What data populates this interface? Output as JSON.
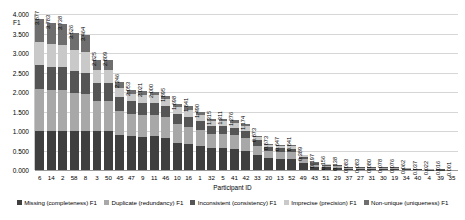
{
  "chart_data": {
    "type": "bar",
    "subtype": "stacked-vertical",
    "title": "",
    "xlabel": "Participant ID",
    "ylabel": "F1",
    "ylim": [
      0,
      4.0
    ],
    "yticks": [
      "0.000",
      "0.500",
      "1.000",
      "1.500",
      "2.000",
      "2.500",
      "3.000",
      "3.500",
      "4.000"
    ],
    "ytick_values": [
      0,
      0.5,
      1.0,
      1.5,
      2.0,
      2.5,
      3.0,
      3.5,
      4.0
    ],
    "grid": true,
    "legend_position": "bottom",
    "categories": [
      "6",
      "14",
      "2",
      "58",
      "8",
      "3",
      "50",
      "45",
      "47",
      "9",
      "11",
      "46",
      "10",
      "16",
      "1",
      "32",
      "5",
      "41",
      "42",
      "33",
      "20",
      "13",
      "52",
      "49",
      "43",
      "51",
      "29",
      "37",
      "27",
      "31",
      "30",
      "19",
      "34",
      "40",
      "4",
      "39",
      "35"
    ],
    "total_labels": [
      "3.877",
      "3.783",
      "3.738",
      "3.526",
      "3.464",
      "2.825",
      "2.809",
      "2.246",
      "2.053",
      "2.021",
      "2.000",
      "1.895",
      "1.698",
      "1.641",
      "1.490",
      "1.315",
      "1.311",
      "1.276",
      "1.174",
      "0.873",
      "0.673",
      "0.647",
      "0.641",
      "0.389",
      "0.197",
      "0.156",
      "0.138",
      "0.083",
      "0.083",
      "0.080",
      "0.078",
      "0.076",
      "0.062",
      "0.037",
      "0.022",
      "0.016",
      "0.001"
    ],
    "totals": [
      3.877,
      3.783,
      3.738,
      3.526,
      3.464,
      2.825,
      2.809,
      2.246,
      2.053,
      2.021,
      2.0,
      1.895,
      1.698,
      1.641,
      1.49,
      1.315,
      1.311,
      1.276,
      1.174,
      0.873,
      0.673,
      0.647,
      0.641,
      0.389,
      0.197,
      0.156,
      0.138,
      0.083,
      0.083,
      0.08,
      0.078,
      0.076,
      0.062,
      0.037,
      0.022,
      0.016,
      0.001
    ],
    "series": [
      {
        "name": "Missing (completeness) F1",
        "color": "#3f3f3f",
        "values": [
          1.0,
          1.0,
          1.0,
          1.0,
          1.0,
          1.0,
          1.0,
          0.9,
          0.87,
          0.85,
          0.86,
          0.83,
          0.7,
          0.66,
          0.62,
          0.56,
          0.56,
          0.54,
          0.5,
          0.38,
          0.3,
          0.28,
          0.275,
          0.17,
          0.085,
          0.068,
          0.06,
          0.036,
          0.036,
          0.035,
          0.034,
          0.033,
          0.027,
          0.016,
          0.01,
          0.007,
          0.0
        ]
      },
      {
        "name": "Duplicate (redundancy) F1",
        "color": "#a8a8a8",
        "values": [
          1.07,
          1.05,
          1.04,
          0.98,
          0.95,
          0.78,
          0.77,
          0.62,
          0.56,
          0.555,
          0.55,
          0.52,
          0.47,
          0.45,
          0.41,
          0.36,
          0.36,
          0.35,
          0.325,
          0.24,
          0.185,
          0.178,
          0.176,
          0.107,
          0.054,
          0.043,
          0.038,
          0.023,
          0.023,
          0.022,
          0.021,
          0.021,
          0.017,
          0.01,
          0.006,
          0.004,
          0.0
        ]
      },
      {
        "name": "Inconsistent (consistency) F1",
        "color": "#555555",
        "values": [
          0.62,
          0.6,
          0.6,
          0.57,
          0.55,
          0.45,
          0.45,
          0.36,
          0.33,
          0.32,
          0.315,
          0.3,
          0.27,
          0.26,
          0.235,
          0.21,
          0.205,
          0.2,
          0.185,
          0.14,
          0.105,
          0.102,
          0.1,
          0.062,
          0.031,
          0.025,
          0.022,
          0.013,
          0.013,
          0.013,
          0.012,
          0.012,
          0.01,
          0.006,
          0.004,
          0.003,
          0.0
        ]
      },
      {
        "name": "Imprecise (precision) F1",
        "color": "#c9c9c9",
        "values": [
          0.6,
          0.58,
          0.57,
          0.54,
          0.53,
          0.34,
          0.34,
          0.22,
          0.2,
          0.195,
          0.19,
          0.18,
          0.17,
          0.165,
          0.15,
          0.13,
          0.13,
          0.125,
          0.11,
          0.08,
          0.06,
          0.058,
          0.057,
          0.035,
          0.018,
          0.014,
          0.012,
          0.007,
          0.007,
          0.007,
          0.007,
          0.007,
          0.005,
          0.003,
          0.002,
          0.001,
          0.0
        ]
      },
      {
        "name": "Non-unique (uniqueness) F1",
        "color": "#6e6e6e",
        "values": [
          0.587,
          0.553,
          0.528,
          0.436,
          0.434,
          0.255,
          0.249,
          0.146,
          0.093,
          0.101,
          0.085,
          0.065,
          0.088,
          0.106,
          0.075,
          0.055,
          0.056,
          0.061,
          0.054,
          0.033,
          0.023,
          0.029,
          0.033,
          0.015,
          0.009,
          0.006,
          0.006,
          0.004,
          0.004,
          0.003,
          0.004,
          0.003,
          0.003,
          0.002,
          0.0,
          0.001,
          0.001
        ]
      }
    ]
  },
  "legend": {
    "items": [
      {
        "label": "Missing (completeness) F1",
        "color": "#3f3f3f"
      },
      {
        "label": "Duplicate (redundancy) F1",
        "color": "#a8a8a8"
      },
      {
        "label": "Inconsistent (consistency) F1",
        "color": "#555555"
      },
      {
        "label": "Imprecise (precision) F1",
        "color": "#c9c9c9"
      },
      {
        "label": "Non-unique (uniqueness) F1",
        "color": "#6e6e6e"
      }
    ]
  }
}
